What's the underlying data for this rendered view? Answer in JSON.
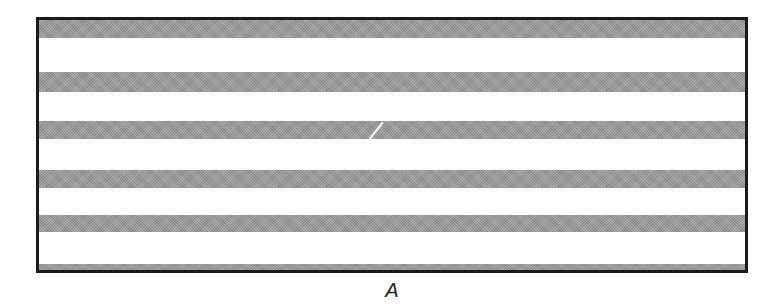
{
  "figure": {
    "label": "A",
    "colors": {
      "border": "#1a1a1a",
      "stripe": "#9a9a9a",
      "background": "#ffffff"
    },
    "stripes": [
      {
        "top": 0,
        "height": 18
      },
      {
        "top": 52,
        "height": 20
      },
      {
        "top": 101,
        "height": 18
      },
      {
        "top": 150,
        "height": 18
      },
      {
        "top": 195,
        "height": 17
      },
      {
        "top": 244,
        "height": 9
      }
    ]
  }
}
